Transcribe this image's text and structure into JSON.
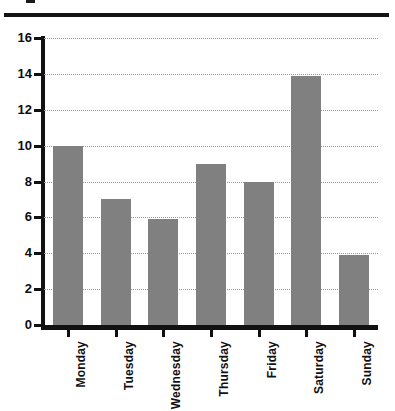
{
  "chart_data": {
    "type": "bar",
    "title": "",
    "subtitle": "",
    "xlabel": "",
    "ylabel": "",
    "categories": [
      "Monday",
      "Tuesday",
      "Wednesday",
      "Thursday",
      "Friday",
      "Saturday",
      "Sunday"
    ],
    "values": [
      10,
      7,
      5.9,
      9,
      8,
      13.9,
      3.9
    ],
    "ylim": [
      0,
      16
    ],
    "ytick_labels": [
      "0",
      "2",
      "4",
      "6",
      "8",
      "10",
      "12",
      "14",
      "16"
    ],
    "ytick_values": [
      0,
      2,
      4,
      6,
      8,
      10,
      12,
      14,
      16
    ],
    "grid": true,
    "grid_style": "dotted-horizontal",
    "legend": null,
    "legend_position": "none",
    "bar_color": "#808080",
    "axis_color": "#111111",
    "grid_color": "#9a9a9a",
    "background": "#ffffff"
  },
  "figure": {
    "top_rule_color": "#141414"
  }
}
